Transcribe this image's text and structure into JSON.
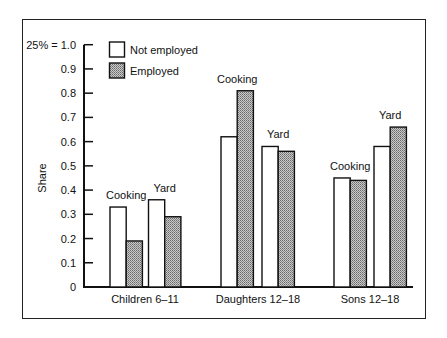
{
  "chart_data": {
    "type": "bar",
    "title": "",
    "xlabel": "",
    "ylabel": "Share",
    "ylim": [
      0,
      1.0
    ],
    "y_ticks": [
      "0",
      "0.1",
      "0.2",
      "0.3",
      "0.4",
      "0.5",
      "0.6",
      "0.7",
      "0.8",
      "0.9",
      "25% = 1.0"
    ],
    "grid": false,
    "legend_position": "top-left",
    "legend": [
      "Not employed",
      "Employed"
    ],
    "categories": [
      "Children 6–11",
      "Daughters 12–18",
      "Sons 12–18"
    ],
    "subgroups": [
      "Cooking",
      "Yard"
    ],
    "series": [
      {
        "name": "Not employed",
        "fill": "#ffffff",
        "values": {
          "Children 6–11": {
            "Cooking": 0.33,
            "Yard": 0.36
          },
          "Daughters 12–18": {
            "Cooking": 0.62,
            "Yard": 0.58
          },
          "Sons 12–18": {
            "Cooking": 0.45,
            "Yard": 0.58
          }
        }
      },
      {
        "name": "Employed",
        "fill": "#a8a8a8",
        "values": {
          "Children 6–11": {
            "Cooking": 0.19,
            "Yard": 0.29
          },
          "Daughters 12–18": {
            "Cooking": 0.81,
            "Yard": 0.56
          },
          "Sons 12–18": {
            "Cooking": 0.44,
            "Yard": 0.66
          }
        }
      }
    ]
  }
}
